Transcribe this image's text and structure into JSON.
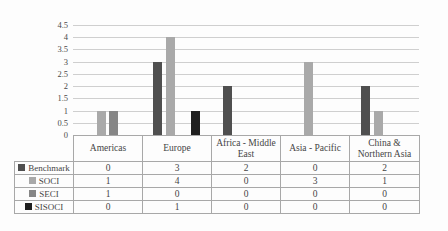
{
  "chart_data": {
    "type": "bar",
    "title": "",
    "xlabel": "",
    "ylabel": "",
    "categories": [
      "Americas",
      "Europe",
      "Africa - Middle East",
      "Asia - Pacific",
      "China & Northern Asia"
    ],
    "series": [
      {
        "name": "Benchmark",
        "color": "#4f4f4f",
        "values": [
          0,
          3,
          2,
          0,
          2
        ]
      },
      {
        "name": "SOCI",
        "color": "#a9a9a9",
        "values": [
          1,
          4,
          0,
          3,
          1
        ]
      },
      {
        "name": "SECI",
        "color": "#868686",
        "values": [
          1,
          0,
          0,
          0,
          0
        ]
      },
      {
        "name": "SISOCI",
        "color": "#1f1f1f",
        "values": [
          0,
          1,
          0,
          0,
          0
        ]
      }
    ],
    "ylim": [
      0,
      4.5
    ],
    "ytick_step": 0.5,
    "yticks": [
      "4.5",
      "4",
      "3.5",
      "3",
      "2.5",
      "2",
      "1.5",
      "1",
      "0.5",
      "0"
    ],
    "grid": true,
    "legend_position": "data-table-row-headers",
    "data_table_shown": true
  },
  "colors": {
    "gridline": "#cfcfcf",
    "table_border": "#a8a8a8",
    "text": "#454545",
    "background": "#fdfdfd"
  }
}
